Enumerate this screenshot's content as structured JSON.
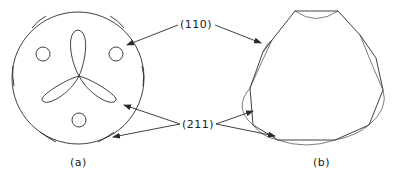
{
  "figure": {
    "panels": [
      {
        "id": "a",
        "caption": "(a)",
        "shape": "circular stereographic outline with trefoil and three small circles"
      },
      {
        "id": "b",
        "caption": "(b)",
        "shape": "faceted polygonal outline with curved facets"
      }
    ],
    "labels": {
      "plane_110": "(110)",
      "plane_211": "(211)"
    },
    "colors": {
      "line": "#2a2a2a",
      "background": "#ffffff"
    }
  }
}
